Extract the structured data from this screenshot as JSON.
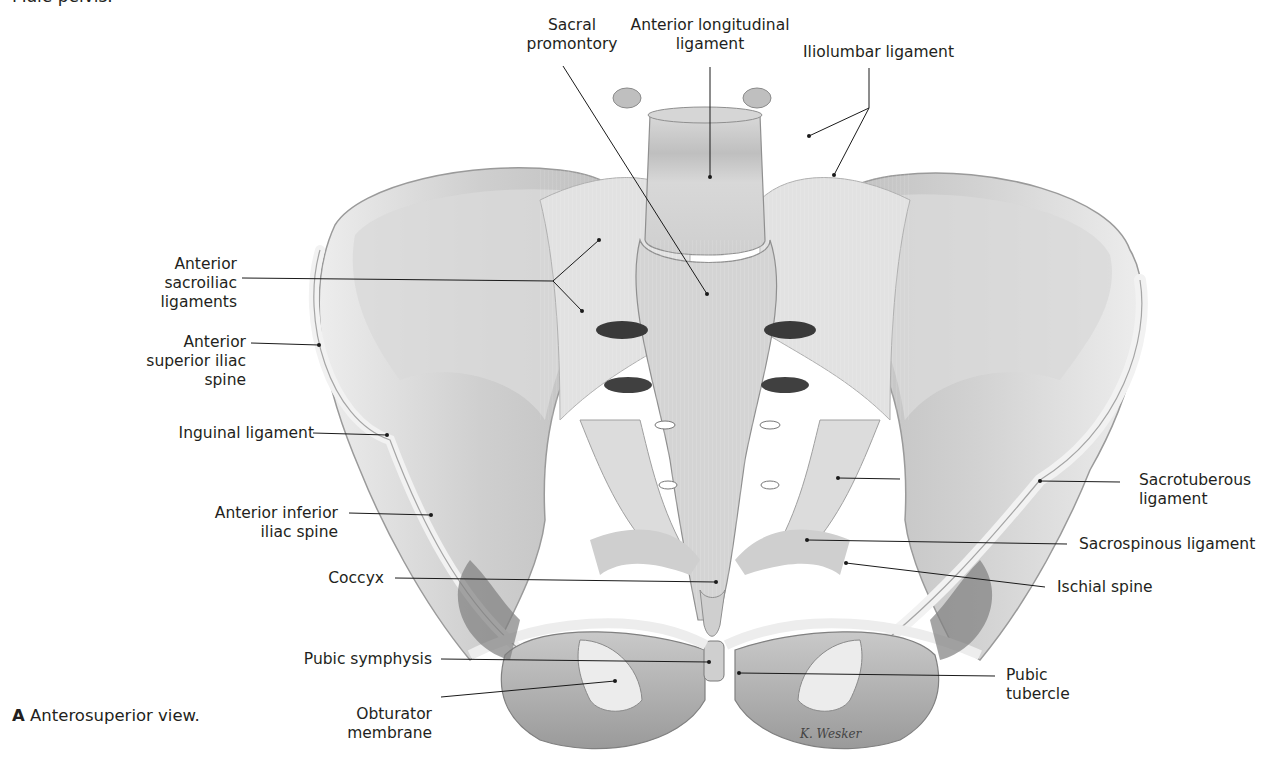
{
  "figure": {
    "top_caption": "Male pelvis.",
    "view_caption": {
      "letter": "A",
      "text": "Anterosuperior view."
    },
    "signature": "K. Wesker"
  },
  "labels": {
    "sacral_promontory": {
      "line1": "Sacral",
      "line2": "promontory"
    },
    "anterior_longitudinal_ligament": {
      "line1": "Anterior longitudinal",
      "line2": "ligament"
    },
    "iliolumbar_ligament": {
      "line1": "Iliolumbar ligament"
    },
    "anterior_sacroiliac_ligaments": {
      "line1": "Anterior",
      "line2": "sacroiliac",
      "line3": "ligaments"
    },
    "anterior_superior_iliac_spine": {
      "line1": "Anterior",
      "line2": "superior iliac",
      "line3": "spine"
    },
    "inguinal_ligament": {
      "line1": "Inguinal ligament"
    },
    "anterior_inferior_iliac_spine": {
      "line1": "Anterior inferior",
      "line2": "iliac spine"
    },
    "coccyx": {
      "line1": "Coccyx"
    },
    "pubic_symphysis": {
      "line1": "Pubic symphysis"
    },
    "obturator_membrane": {
      "line1": "Obturator",
      "line2": "membrane"
    },
    "sacrotuberous_ligament": {
      "line1": "Sacrotuberous",
      "line2": "ligament"
    },
    "sacrospinous_ligament": {
      "line1": "Sacrospinous ligament"
    },
    "ischial_spine": {
      "line1": "Ischial spine"
    },
    "pubic_tubercle": {
      "line1": "Pubic",
      "line2": "tubercle"
    }
  },
  "colors": {
    "background": "#ffffff",
    "text": "#231f20",
    "leader_line": "#1a1a1a",
    "bone_light": "#e6e6e6",
    "bone_mid": "#c8c8c8",
    "bone_dark": "#8c8c8c",
    "foramen_dark": "#3a3a3a"
  }
}
